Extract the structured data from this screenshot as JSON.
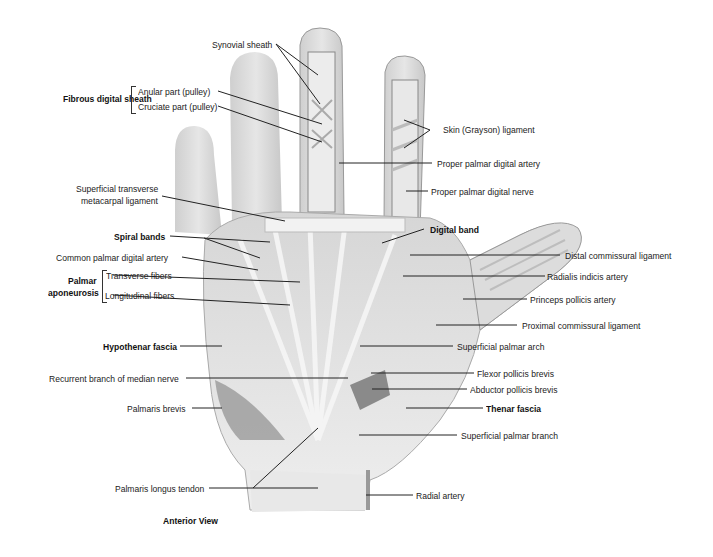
{
  "figure": {
    "caption": "Anterior View",
    "colors": {
      "skin": "#dcdcdc",
      "tendon": "#f0f0f0",
      "shadow": "#9a9a9a",
      "line": "#222222"
    }
  },
  "labels": {
    "synovial_sheath": "Synovial sheath",
    "fibrous_digital_sheath": "Fibrous digital sheath",
    "anular_part": "Anular part (pulley)",
    "cruciate_part": "Cruciate part (pulley)",
    "skin_grayson": "Skin (Grayson) ligament",
    "proper_palmar_digital_artery": "Proper palmar digital artery",
    "proper_palmar_digital_nerve": "Proper palmar digital nerve",
    "superficial_transverse_1": "Superficial transverse",
    "superficial_transverse_2": "metacarpal ligament",
    "spiral_bands": "Spiral bands",
    "digital_band": "Digital band",
    "common_palmar_digital_artery": "Common palmar digital artery",
    "distal_commissural": "Distal commissural ligament",
    "palmar_1": "Palmar",
    "palmar_2": "aponeurosis",
    "transverse_fibers": "Transverse fibers",
    "longitudinal_fibers": "Longitudinal fibers",
    "radialis_indicis": "Radialis indicis artery",
    "princeps_pollicis": "Princeps pollicis artery",
    "proximal_commissural": "Proximal commissural ligament",
    "hypothenar_fascia": "Hypothenar fascia",
    "superficial_palmar_arch": "Superficial palmar arch",
    "recurrent_branch": "Recurrent branch of median nerve",
    "flexor_pollicis_brevis": "Flexor pollicis brevis",
    "abductor_pollicis_brevis": "Abductor pollicis brevis",
    "palmaris_brevis": "Palmaris brevis",
    "thenar_fascia": "Thenar fascia",
    "superficial_palmar_branch": "Superficial palmar branch",
    "palmaris_longus": "Palmaris longus tendon",
    "radial_artery": "Radial artery"
  }
}
